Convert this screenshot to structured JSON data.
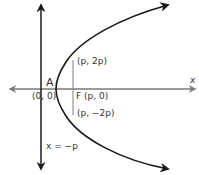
{
  "diagram": {
    "colors": {
      "curve": "#1a1a1a",
      "directrix": "#1a1a1a",
      "axis": "#7a7a7a",
      "latus_rectum": "#8a8a8a",
      "text": "#333333"
    },
    "labels": {
      "x_axis": "x",
      "vertex_letter": "A",
      "vertex_coords": "(0, 0)",
      "focus": "F (p, 0)",
      "upper_point": "(p, 2p)",
      "lower_point": "(p, −2p)",
      "directrix": "x = −p"
    }
  }
}
